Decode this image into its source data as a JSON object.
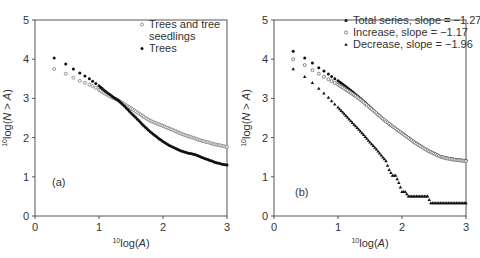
{
  "chart_data": [
    {
      "type": "scatter",
      "panel_label": "(a)",
      "xlabel_prefix": "10",
      "xlabel": "log(A)",
      "ylabel_prefix": "10",
      "ylabel": "log(N > A)",
      "xlim": [
        0,
        3
      ],
      "ylim": [
        0,
        5
      ],
      "xticks": [
        "0",
        "1",
        "2",
        "3"
      ],
      "yticks": [
        "0",
        "1",
        "2",
        "3",
        "4",
        "5"
      ],
      "grid": false,
      "legend_position": "upper right",
      "series": [
        {
          "name": "Trees and tree seedlings",
          "legend_lines": [
            "Trees and tree",
            "seedlings"
          ],
          "marker": "open-circle",
          "color": "#888888",
          "x": [
            0.3,
            0.48,
            0.6,
            0.7,
            0.78,
            0.85,
            0.9,
            0.95,
            1.0,
            1.1,
            1.2,
            1.3,
            1.4,
            1.5,
            1.6,
            1.7,
            1.8,
            1.9,
            2.0,
            2.1,
            2.2,
            2.3,
            2.4,
            2.5,
            2.6,
            2.7,
            2.8,
            2.9,
            3.0
          ],
          "y": [
            3.75,
            3.63,
            3.53,
            3.45,
            3.4,
            3.35,
            3.31,
            3.27,
            3.22,
            3.12,
            3.03,
            2.95,
            2.85,
            2.75,
            2.64,
            2.53,
            2.43,
            2.36,
            2.3,
            2.23,
            2.16,
            2.09,
            2.03,
            1.98,
            1.92,
            1.88,
            1.83,
            1.8,
            1.76
          ]
        },
        {
          "name": "Trees",
          "legend_lines": [
            "Trees"
          ],
          "marker": "filled-circle",
          "color": "#111111",
          "x": [
            0.3,
            0.48,
            0.6,
            0.7,
            0.78,
            0.85,
            0.9,
            0.95,
            1.0,
            1.1,
            1.2,
            1.3,
            1.4,
            1.5,
            1.6,
            1.7,
            1.8,
            1.9,
            2.0,
            2.1,
            2.2,
            2.3,
            2.4,
            2.5,
            2.6,
            2.7,
            2.8,
            2.9,
            3.0
          ],
          "y": [
            4.03,
            3.88,
            3.75,
            3.65,
            3.57,
            3.5,
            3.44,
            3.38,
            3.32,
            3.18,
            3.06,
            2.95,
            2.8,
            2.63,
            2.47,
            2.3,
            2.15,
            2.02,
            1.9,
            1.8,
            1.72,
            1.65,
            1.6,
            1.57,
            1.5,
            1.44,
            1.38,
            1.33,
            1.3
          ]
        }
      ]
    },
    {
      "type": "scatter",
      "panel_label": "(b)",
      "xlabel_prefix": "10",
      "xlabel": "log(A)",
      "ylabel_prefix": "10",
      "ylabel": "log(N > A)",
      "xlim": [
        0,
        3
      ],
      "ylim": [
        0,
        5
      ],
      "xticks": [
        "0",
        "1",
        "2",
        "3"
      ],
      "yticks": [
        "0",
        "1",
        "2",
        "3",
        "4",
        "5"
      ],
      "grid": false,
      "legend_position": "upper right",
      "series": [
        {
          "name": "Total series, slope = −1.27",
          "marker": "filled-circle",
          "color": "#111111",
          "slope": -1.27,
          "x": [
            0.3,
            0.48,
            0.6,
            0.7,
            0.78,
            0.85,
            0.9,
            0.95,
            1.0,
            1.1,
            1.2,
            1.3,
            1.4,
            1.5,
            1.6,
            1.7,
            1.8,
            1.9,
            2.0,
            2.1,
            2.2,
            2.3,
            2.4,
            2.5,
            2.6,
            2.7,
            2.8,
            2.9,
            3.0
          ],
          "y": [
            4.2,
            4.03,
            3.9,
            3.78,
            3.7,
            3.62,
            3.56,
            3.5,
            3.45,
            3.33,
            3.2,
            3.07,
            2.93,
            2.78,
            2.63,
            2.48,
            2.35,
            2.23,
            2.12,
            2.0,
            1.88,
            1.78,
            1.68,
            1.6,
            1.52,
            1.48,
            1.45,
            1.43,
            1.42
          ]
        },
        {
          "name": "Increase, slope = −1.17",
          "marker": "open-circle",
          "color": "#777777",
          "slope": -1.17,
          "x": [
            0.3,
            0.48,
            0.6,
            0.7,
            0.78,
            0.85,
            0.9,
            0.95,
            1.0,
            1.1,
            1.2,
            1.3,
            1.4,
            1.5,
            1.6,
            1.7,
            1.8,
            1.9,
            2.0,
            2.1,
            2.2,
            2.3,
            2.4,
            2.5,
            2.6,
            2.7,
            2.8,
            2.9,
            3.0
          ],
          "y": [
            4.0,
            3.85,
            3.72,
            3.63,
            3.55,
            3.49,
            3.44,
            3.39,
            3.35,
            3.25,
            3.14,
            3.03,
            2.9,
            2.76,
            2.62,
            2.48,
            2.35,
            2.23,
            2.11,
            1.99,
            1.87,
            1.77,
            1.67,
            1.59,
            1.51,
            1.47,
            1.44,
            1.42,
            1.4
          ]
        },
        {
          "name": "Decrease, slope = −1.96",
          "marker": "filled-triangle",
          "color": "#111111",
          "slope": -1.96,
          "x": [
            0.3,
            0.48,
            0.6,
            0.7,
            0.78,
            0.85,
            0.9,
            0.95,
            1.0,
            1.1,
            1.2,
            1.3,
            1.4,
            1.5,
            1.6,
            1.7,
            1.75,
            1.8,
            1.85,
            1.9,
            1.95,
            2.0,
            2.05,
            2.1,
            2.2,
            2.3,
            2.4,
            2.45,
            2.55,
            2.65,
            2.75,
            2.85,
            3.0
          ],
          "y": [
            3.75,
            3.55,
            3.4,
            3.25,
            3.13,
            3.02,
            2.93,
            2.85,
            2.77,
            2.6,
            2.42,
            2.25,
            2.07,
            1.88,
            1.7,
            1.5,
            1.4,
            1.18,
            1.03,
            1.03,
            0.85,
            0.62,
            0.62,
            0.5,
            0.5,
            0.5,
            0.5,
            0.33,
            0.33,
            0.33,
            0.33,
            0.33,
            0.33
          ]
        }
      ]
    }
  ]
}
